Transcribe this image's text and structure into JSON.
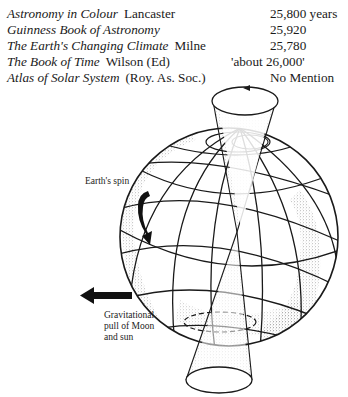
{
  "sources_table": {
    "rows": [
      {
        "title": "Astronomy in Colour",
        "author": "Lancaster",
        "value": "25,800 years"
      },
      {
        "title": "Guinness Book of Astronomy",
        "author": "",
        "value": "25,920"
      },
      {
        "title": "The Earth's Changing Climate",
        "author": "Milne",
        "value": "25,780"
      },
      {
        "title": "The Book of Time",
        "author": "Wilson (Ed)",
        "value": "'about 26,000'"
      },
      {
        "title": "Atlas of Solar System",
        "author": "(Roy. As. Soc.)",
        "value": "No Mention"
      }
    ]
  },
  "diagram": {
    "labels": {
      "spin": "Earth's spin",
      "gravity_line1": "Gravitational",
      "gravity_line2": "pull of Moon",
      "gravity_line3": "and sun"
    },
    "icons": [
      "precession-cone",
      "globe",
      "spin-arrow-icon",
      "gravity-arrow-icon"
    ],
    "colors": {
      "ink": "#1a1a1a",
      "stipple": "#8a8a8a",
      "paper": "#ffffff"
    }
  }
}
